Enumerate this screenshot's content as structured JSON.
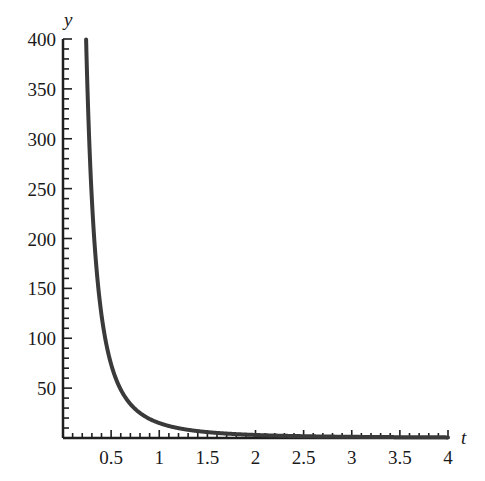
{
  "chart_data": {
    "type": "line",
    "title": "",
    "xlabel": "t",
    "ylabel": "y",
    "xlim": [
      0,
      4
    ],
    "ylim": [
      0,
      400
    ],
    "x_ticks": [
      0.5,
      1,
      1.5,
      2,
      2.5,
      3,
      3.5,
      4
    ],
    "x_tick_labels": [
      "0.5",
      "1",
      "1.5",
      "2",
      "2.5",
      "3",
      "3.5",
      "4"
    ],
    "x_minor_step": 0.1,
    "y_ticks": [
      50,
      100,
      150,
      200,
      250,
      300,
      350,
      400
    ],
    "y_tick_labels": [
      "50",
      "100",
      "150",
      "200",
      "250",
      "300",
      "350",
      "400"
    ],
    "y_minor_step": 10,
    "grid": false,
    "legend": null,
    "series": [
      {
        "name": "y(t)",
        "color": "#3a3a3a",
        "formula_approx": "y ≈ 15 / t^2.3",
        "x": [
          0.24,
          0.26,
          0.28,
          0.3,
          0.33,
          0.36,
          0.4,
          0.45,
          0.5,
          0.55,
          0.6,
          0.7,
          0.8,
          0.9,
          1.0,
          1.2,
          1.4,
          1.6,
          1.8,
          2.0,
          2.5,
          3.0,
          3.5,
          4.0
        ],
        "y": [
          400,
          333,
          281,
          239,
          192,
          157,
          124,
          94,
          74,
          60,
          49,
          34,
          25,
          19,
          15,
          10.4,
          7.2,
          5.4,
          4.2,
          3.1,
          1.8,
          1.2,
          0.9,
          0.7
        ]
      }
    ]
  }
}
